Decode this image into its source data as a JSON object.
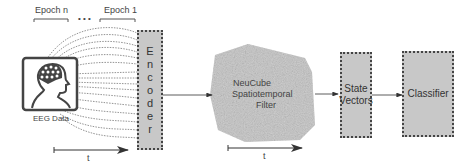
{
  "epochs": {
    "first_label": "Epoch n",
    "ellipsis": "• • •",
    "last_label": "Epoch 1"
  },
  "input": {
    "label": "EEG Data",
    "icon": "eeg-head-icon"
  },
  "encoder": {
    "letters": [
      "E",
      "n",
      "c",
      "o",
      "d",
      "e",
      "r"
    ]
  },
  "neucube": {
    "line1": "NeuCube",
    "line2": "Spatiotemporal",
    "line3": "Filter"
  },
  "state_vectors": {
    "line1": "State",
    "line2": "Vectors"
  },
  "classifier": {
    "label": "Classifier"
  },
  "time_axes": [
    {
      "label": "t"
    },
    {
      "label": "t"
    }
  ],
  "colors": {
    "box_fill": "#c8c8c8",
    "border": "#444444",
    "cube": "#b8b8b8"
  }
}
